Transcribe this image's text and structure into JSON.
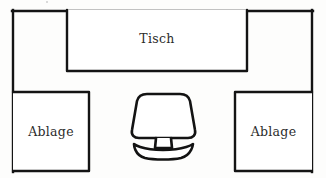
{
  "diagram": {
    "kind": "floor-plan-sketch",
    "title_text": "",
    "background_color": "#fdfdfc",
    "line_color": "#141414",
    "label_color": "#2b2b2b",
    "labels": {
      "desk": "Tisch",
      "shelf_left": "Ablage",
      "shelf_right": "Ablage"
    },
    "elements": [
      {
        "name": "room-outline",
        "label": "",
        "shape": "open-rectangle",
        "left": 12,
        "top": 10,
        "right": 313,
        "bottom": 172,
        "bottom_open": true
      },
      {
        "name": "desk",
        "label": "Tisch",
        "shape": "rectangle",
        "left": 67,
        "top": 10,
        "right": 247,
        "bottom": 72
      },
      {
        "name": "shelf-left",
        "label": "Ablage",
        "shape": "rectangle",
        "left": 12,
        "top": 91,
        "right": 90,
        "bottom": 172
      },
      {
        "name": "shelf-right",
        "label": "Ablage",
        "shape": "rectangle",
        "left": 234,
        "top": 91,
        "right": 313,
        "bottom": 172
      },
      {
        "name": "chair",
        "label": "",
        "shape": "swivel-chair-top-view",
        "center_x": 163,
        "top": 93,
        "bottom": 157
      }
    ]
  }
}
